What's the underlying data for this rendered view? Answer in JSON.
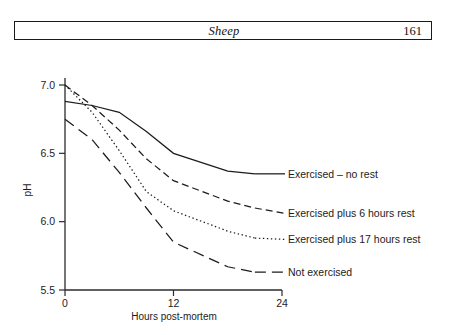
{
  "header": {
    "title": "Sheep",
    "page_number": "161"
  },
  "chart_data": {
    "type": "line",
    "title": "",
    "xlabel": "Hours post-mortem",
    "ylabel": "pH",
    "xlim": [
      0,
      24
    ],
    "ylim": [
      5.5,
      7.0
    ],
    "x_ticks": [
      "0",
      "12",
      "24"
    ],
    "x_tick_values": [
      0,
      12,
      24
    ],
    "y_ticks": [
      "5.5",
      "6.0",
      "6.5",
      "7.0"
    ],
    "y_tick_values": [
      5.5,
      6.0,
      6.5,
      7.0
    ],
    "grid": false,
    "legend_position": "right-inline",
    "series": [
      {
        "name": "Exercised – no rest",
        "style": "solid",
        "label": "Exercised – no rest",
        "x": [
          0,
          3,
          6,
          9,
          12,
          18,
          21
        ],
        "y": [
          6.88,
          6.85,
          6.8,
          6.66,
          6.5,
          6.37,
          6.35
        ],
        "label_x": 24,
        "label_y": 6.35
      },
      {
        "name": "Exercised plus 6 hours rest",
        "style": "dashed",
        "label": "Exercised plus 6 hours rest",
        "x": [
          0,
          3,
          6,
          9,
          12,
          18,
          21
        ],
        "y": [
          7.0,
          6.85,
          6.67,
          6.46,
          6.3,
          6.15,
          6.1
        ],
        "label_x": 24,
        "label_y": 6.06
      },
      {
        "name": "Exercised plus 17 hours rest",
        "style": "dotted",
        "label": "Exercised plus 17 hours rest",
        "x": [
          0,
          3,
          6,
          9,
          12,
          18,
          21
        ],
        "y": [
          7.0,
          6.8,
          6.52,
          6.22,
          6.08,
          5.93,
          5.88
        ],
        "label_x": 24,
        "label_y": 5.87
      },
      {
        "name": "Not exercised",
        "style": "longdash",
        "label": "Not exercised",
        "x": [
          0,
          3,
          6,
          9,
          12,
          18,
          21
        ],
        "y": [
          6.75,
          6.6,
          6.36,
          6.1,
          5.85,
          5.67,
          5.63
        ],
        "label_x": 24,
        "label_y": 5.63
      }
    ]
  }
}
